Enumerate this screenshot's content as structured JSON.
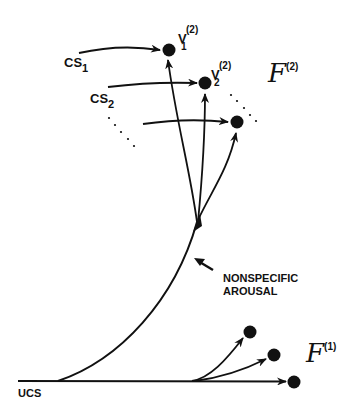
{
  "diagram": {
    "labels": {
      "cs1": {
        "base": "CS",
        "sub": "1"
      },
      "cs2": {
        "base": "CS",
        "sub": "2"
      },
      "v1": {
        "base": "V",
        "sub": "1",
        "sup": "(2)"
      },
      "v2": {
        "base": "V",
        "sub": "2",
        "sup": "(2)"
      },
      "f2": {
        "base": "F",
        "sup": "(2)"
      },
      "f1": {
        "base": "F",
        "sup": "(1)"
      },
      "ucs": "UCS",
      "arousal_line1": "NONSPECIFIC",
      "arousal_line2": "AROUSAL"
    },
    "colors": {
      "ink": "#111111",
      "background": "#ffffff"
    },
    "nodes": {
      "field2": [
        {
          "id": "v1",
          "x": 169,
          "y": 50
        },
        {
          "id": "v2",
          "x": 205,
          "y": 83
        },
        {
          "id": "v3",
          "x": 237,
          "y": 122
        }
      ],
      "field1": [
        {
          "id": "u1",
          "x": 250,
          "y": 332
        },
        {
          "id": "u2",
          "x": 274,
          "y": 355
        },
        {
          "id": "u3",
          "x": 294,
          "y": 382
        }
      ]
    }
  }
}
